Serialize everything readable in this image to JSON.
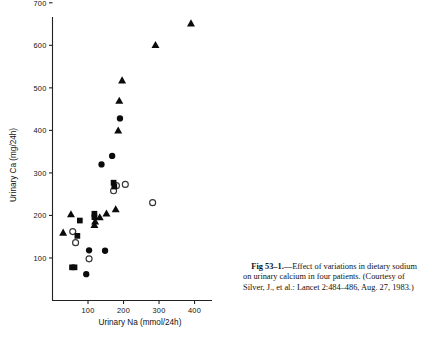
{
  "figure": {
    "caption": {
      "label": "Fig 53–1.",
      "dash": "—",
      "text": "Effect of variations in dietary sodium on urinary calcium in four patients.",
      "source": "(Courtesy of Silver, J., et al.: Lancet 2:484–486, Aug. 27, 1983.)"
    }
  },
  "chart_data": {
    "type": "scatter",
    "title": "",
    "xlabel": "Urinary Na (mmol/24h)",
    "ylabel": "Urinary Ca (mg/24h)",
    "xlim": [
      0,
      440
    ],
    "ylim": [
      0,
      700
    ],
    "xticks": [
      100,
      200,
      300,
      400
    ],
    "yticks": [
      100,
      200,
      300,
      400,
      500,
      600,
      700
    ],
    "grid": false,
    "legend": "none",
    "marker_color": "#0b0b0b",
    "series": [
      {
        "name": "patient-1",
        "marker": "filled-triangle",
        "points": [
          [
            30,
            160
          ],
          [
            52,
            203
          ],
          [
            118,
            178
          ],
          [
            120,
            186
          ],
          [
            133,
            196
          ],
          [
            152,
            205
          ],
          [
            178,
            215
          ],
          [
            185,
            400
          ],
          [
            188,
            470
          ],
          [
            196,
            518
          ],
          [
            290,
            601
          ],
          [
            390,
            652
          ]
        ]
      },
      {
        "name": "patient-2",
        "marker": "filled-circle",
        "points": [
          [
            95,
            62
          ],
          [
            103,
            118
          ],
          [
            148,
            117
          ],
          [
            138,
            320
          ],
          [
            168,
            340
          ],
          [
            190,
            428
          ]
        ]
      },
      {
        "name": "patient-3",
        "marker": "open-circle",
        "points": [
          [
            57,
            162
          ],
          [
            65,
            136
          ],
          [
            103,
            98
          ],
          [
            172,
            258
          ],
          [
            180,
            270
          ],
          [
            205,
            273
          ],
          [
            282,
            230
          ]
        ]
      },
      {
        "name": "patient-4",
        "marker": "filled-square",
        "points": [
          [
            55,
            78
          ],
          [
            62,
            78
          ],
          [
            70,
            152
          ],
          [
            77,
            188
          ],
          [
            118,
            196
          ],
          [
            118,
            204
          ],
          [
            172,
            277
          ],
          [
            174,
            268
          ]
        ]
      }
    ]
  }
}
